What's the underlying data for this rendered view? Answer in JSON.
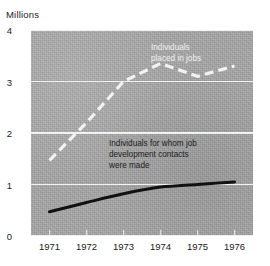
{
  "chart_data": {
    "type": "line",
    "title": "",
    "ylabel": "Millions",
    "xlabel": "",
    "x": [
      "1971",
      "1972",
      "1973",
      "1974",
      "1975",
      "1976"
    ],
    "ytick_labels": [
      "4",
      "3",
      "2",
      "1",
      "0"
    ],
    "ytick_values": [
      4,
      3,
      2,
      1,
      0
    ],
    "ylim": [
      0,
      4
    ],
    "grid": "horizontal",
    "legend_position": "inline-annotations",
    "series": [
      {
        "name": "Individuals placed in jobs",
        "style": "dashed",
        "color": "#f2f2f2",
        "values": [
          1.47,
          2.2,
          3.0,
          3.35,
          3.1,
          3.3
        ]
      },
      {
        "name": "Individuals for whom job development contacts were made",
        "style": "solid",
        "color": "#111111",
        "values": [
          0.47,
          0.65,
          0.82,
          0.95,
          1.0,
          1.05
        ]
      }
    ],
    "annotations": [
      {
        "text": "Individuals\nplaced in jobs",
        "series": "Individuals placed in jobs",
        "color": "#f0f0f0"
      },
      {
        "text": "Individuals for whom job\ndevelopment contacts\nwere made",
        "series": "Individuals for whom job development contacts were made",
        "color": "#1c1c1c"
      }
    ]
  },
  "labels": {
    "unit": "Millions",
    "y": [
      "4",
      "3",
      "2",
      "1",
      "0"
    ],
    "x": [
      "1971",
      "1972",
      "1973",
      "1974",
      "1975",
      "1976"
    ],
    "annotation_top": "Individuals\nplaced in jobs",
    "annotation_bottom": "Individuals for whom job\ndevelopment contacts\nwere made"
  },
  "colors": {
    "panel": "#a9a9a9",
    "grid": "#f2f2f2",
    "dashed_series": "#f2f2f2",
    "solid_series": "#111111",
    "text": "#1a1a1a"
  }
}
